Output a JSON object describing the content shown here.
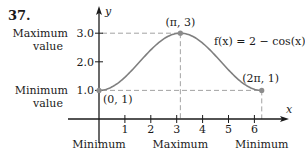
{
  "problem_number": "37.",
  "chart_data": {
    "type": "line",
    "title": "",
    "function_label": "f(x) = 2 − cos(x)",
    "xlabel": "x",
    "ylabel": "y",
    "xlim": [
      0,
      6.9
    ],
    "ylim": [
      0,
      3.5
    ],
    "x_ticks": [
      1,
      2,
      3,
      4,
      5,
      6
    ],
    "x_tick_labels": [
      "1",
      "2",
      "3",
      "4",
      "5",
      "6"
    ],
    "y_ticks": [
      1,
      2,
      3
    ],
    "y_tick_labels": [
      "1.0",
      "2.0",
      "3.0"
    ],
    "domain": [
      0,
      6.283185
    ],
    "series": [
      {
        "name": "f(x) = 2 − cos(x)",
        "expression": "2 - cos(x)"
      }
    ],
    "points": [
      {
        "x": 0,
        "y": 1,
        "label": "(0, 1)"
      },
      {
        "x": 3.141593,
        "y": 3,
        "label": "(π, 3)"
      },
      {
        "x": 6.283185,
        "y": 1,
        "label": "(2π, 1)"
      }
    ],
    "annotations": {
      "max_value_label": [
        "Maximum",
        "value"
      ],
      "min_value_label": [
        "Minimum",
        "value"
      ],
      "x_annotations": [
        {
          "x": 0,
          "text": "Minimum"
        },
        {
          "x": 3.141593,
          "text": "Maximum"
        },
        {
          "x": 6.283185,
          "text": "Minimum"
        }
      ]
    },
    "colors": {
      "curve": "#7f7f7f",
      "points": "#8c8c8c",
      "axes": "#1a1a1a",
      "dashes": "#999999"
    }
  }
}
